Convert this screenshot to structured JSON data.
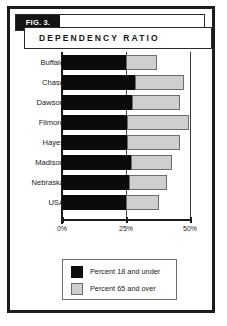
{
  "figure": {
    "tag": "FIG. 3.",
    "title": "DEPENDENCY RATIO"
  },
  "legend": {
    "items": [
      {
        "label": "Percent 18 and under",
        "swatch": "black-swatch-icon",
        "color": "#0b0b0b"
      },
      {
        "label": "Percent 65 and over",
        "swatch": "gray-swatch-icon",
        "color": "#cfcfcf"
      }
    ]
  },
  "axis": {
    "ticks": [
      "0%",
      "25%",
      "50%"
    ]
  },
  "chart_data": {
    "type": "bar",
    "orientation": "horizontal",
    "stacked": true,
    "title": "DEPENDENCY RATIO",
    "xlabel": "",
    "ylabel": "",
    "xlim": [
      0,
      50
    ],
    "xticks": [
      0,
      25,
      50
    ],
    "xtick_labels": [
      "0%",
      "25%",
      "50%"
    ],
    "grid": true,
    "legend_position": "bottom-left",
    "categories": [
      "Buffalo",
      "Chase",
      "Dawson",
      "Filmore",
      "Hayes",
      "Madison",
      "Nebraska",
      "USA"
    ],
    "series": [
      {
        "name": "Percent 18 and under",
        "color": "#0b0b0b",
        "values": [
          25,
          28.5,
          27.5,
          25.5,
          25.5,
          27,
          26,
          25
        ]
      },
      {
        "name": "Percent 65 and over",
        "color": "#cfcfcf",
        "values": [
          12,
          19,
          18.5,
          24,
          20.5,
          16,
          15,
          13
        ]
      }
    ],
    "totals": [
      37,
      47.5,
      46,
      49.5,
      46,
      43,
      41,
      38
    ]
  }
}
